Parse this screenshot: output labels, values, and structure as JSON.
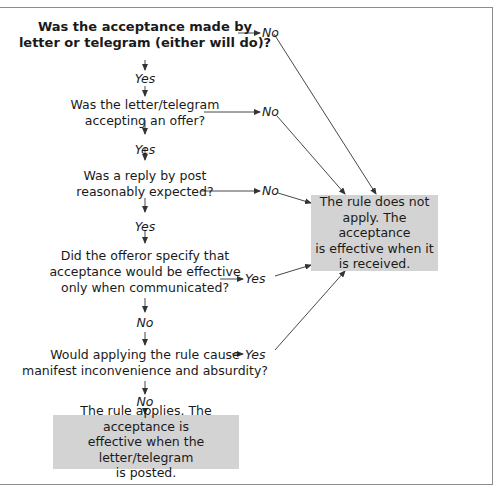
{
  "diagram": {
    "questions": [
      {
        "id": "q1",
        "lines": [
          "Was the acceptance made by",
          "letter or telegram (either will do)?"
        ],
        "yes_label": "Yes",
        "side_label": "No",
        "bold": true
      },
      {
        "id": "q2",
        "lines": [
          "Was the letter/telegram",
          "accepting an offer?"
        ],
        "yes_label": "Yes",
        "side_label": "No"
      },
      {
        "id": "q3",
        "lines": [
          "Was a reply by post",
          "reasonably expected?"
        ],
        "yes_label": "Yes",
        "side_label": "No"
      },
      {
        "id": "q4",
        "lines": [
          "Did the offeror specify that",
          "acceptance would be effective",
          "only when communicated?"
        ],
        "down_label": "No",
        "side_label": "Yes"
      },
      {
        "id": "q5",
        "lines": [
          "Would applying the rule cause",
          "manifest inconvenience and absurdity?"
        ],
        "down_label": "No",
        "side_label": "Yes"
      }
    ],
    "outcome_not_apply": {
      "lines": [
        "The rule does not",
        "apply. The acceptance",
        "is effective when it",
        "is received."
      ]
    },
    "outcome_applies": {
      "lines": [
        "The rule applies. The acceptance is",
        "effective when the letter/telegram",
        "is posted."
      ]
    },
    "colors": {
      "box_fill": "#d3d3d3",
      "line": "#333333",
      "frame": "#8c8c8c"
    }
  }
}
